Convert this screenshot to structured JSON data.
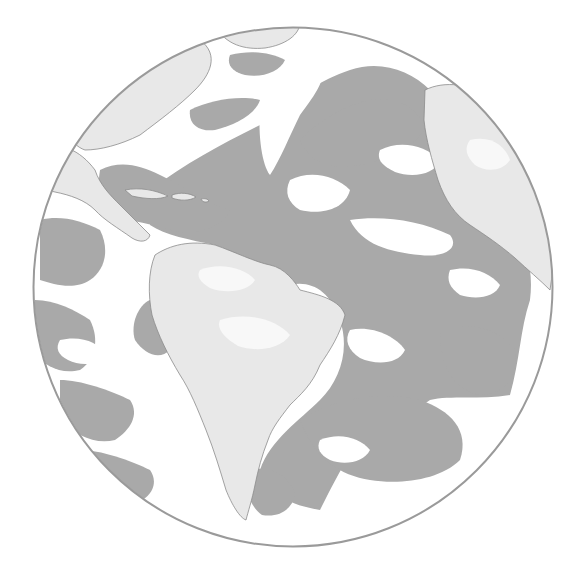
{
  "image": {
    "subject": "Earth globe viewed over the Atlantic Ocean",
    "style": "grayscale satellite illustration",
    "regions_visible": [
      "North America (east)",
      "Caribbean",
      "South America",
      "Atlantic Ocean",
      "West Africa"
    ]
  },
  "colors": {
    "background": "#ffffff",
    "ocean": "#a9a9a9",
    "land": "#e8e8e8",
    "cloud": "#ffffff",
    "outline": "#9a9a9a",
    "coastline": "#8c8c8c"
  },
  "globe": {
    "cx": 293,
    "cy": 287,
    "r": 260
  }
}
